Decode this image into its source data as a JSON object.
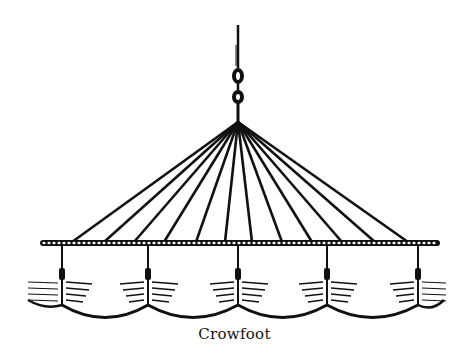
{
  "figure": {
    "caption": "Crowfoot",
    "ink_color": "#111111",
    "background": "#ffffff",
    "apex": {
      "x": 238,
      "y": 122
    },
    "rope": {
      "x1": 40,
      "x2": 440,
      "y": 243
    },
    "line_endpoints_x": [
      72,
      104,
      134,
      164,
      196,
      225,
      252,
      282,
      312,
      342,
      375,
      408
    ],
    "hangers_x": [
      62,
      148,
      238,
      327,
      418
    ],
    "spike": {
      "x": 238,
      "top": 25,
      "ring1_y": 78,
      "ring2_y": 98
    }
  }
}
